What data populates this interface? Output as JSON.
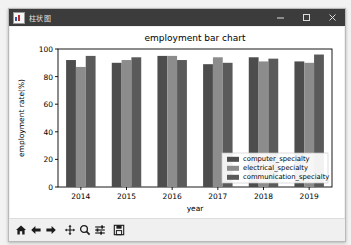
{
  "window": {
    "title": "柱状图",
    "app_icon": "chart-app-icon",
    "controls": [
      {
        "name": "minimize",
        "glyph": "minimize-icon"
      },
      {
        "name": "maximize",
        "glyph": "maximize-icon"
      },
      {
        "name": "close",
        "glyph": "close-icon"
      }
    ]
  },
  "toolbar": {
    "buttons": [
      {
        "name": "home-button",
        "icon": "home-icon"
      },
      {
        "name": "back-button",
        "icon": "arrow-left-icon"
      },
      {
        "name": "forward-button",
        "icon": "arrow-right-icon"
      },
      {
        "name": "pan-button",
        "icon": "move-cross-icon"
      },
      {
        "name": "zoom-button",
        "icon": "magnifier-icon"
      },
      {
        "name": "configure-subplots-button",
        "icon": "sliders-icon"
      },
      {
        "name": "save-button",
        "icon": "floppy-disk-icon"
      }
    ]
  },
  "colors": {
    "series1": "#4d4d4d",
    "series2": "#8c8c8c",
    "series3": "#5a5a5a",
    "axes_line": "#000000",
    "title_bar": "#3c3c3c",
    "canvas": "#ffffff"
  },
  "chart_data": {
    "type": "bar",
    "title": "employment bar chart",
    "xlabel": "year",
    "ylabel": "employment rate(%)",
    "categories": [
      "2014",
      "2015",
      "2016",
      "2017",
      "2018",
      "2019"
    ],
    "series": [
      {
        "name": "computer_specialty",
        "values": [
          92,
          90,
          95,
          89,
          94,
          91
        ]
      },
      {
        "name": "electrical_specialty",
        "values": [
          87,
          92,
          95,
          94,
          91,
          90
        ]
      },
      {
        "name": "communication_specialty",
        "values": [
          95,
          94,
          92,
          90,
          93,
          96
        ]
      }
    ],
    "ylim": [
      0,
      100
    ],
    "yticks": [
      0,
      20,
      40,
      60,
      80,
      100
    ],
    "grid": false,
    "legend_position": "lower right"
  }
}
